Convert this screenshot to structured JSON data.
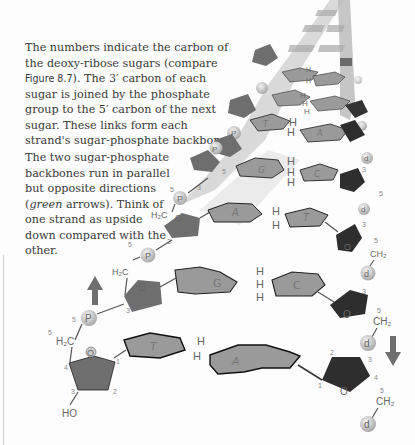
{
  "caption": {
    "paragraph1_a": "The numbers indicate the carbon of the deoxy-ribose sugars (compare ",
    "paragraph1_ref": "Figure 8.7",
    "paragraph1_b": "). The 3′ carbon of each sugar is joined by the phosphate group to the 5′ carbon of the next sugar. These links form each strand's sugar-phosphate backbone.",
    "paragraph2_a": "The two sugar-phosphate backbones run in parallel but opposite directions (",
    "paragraph2_em": "green",
    "paragraph2_b": " arrows). Think of one strand as upside down compared with the other."
  },
  "diagram": {
    "phosphate_label": "P",
    "oxygen_label": "O",
    "hydroxyl_label": "HO",
    "ch2_left": "H₂C",
    "ch2_right": "CH₂",
    "hydrogen_label": "H",
    "carbon_numbers": {
      "c1": "1",
      "c2": "2",
      "c3": "3",
      "c4": "4",
      "c5": "5"
    },
    "base_pairs": [
      {
        "left": "T",
        "right": "A",
        "h_bonds": 2
      },
      {
        "left": "G",
        "right": "C",
        "h_bonds": 3
      },
      {
        "left": "A",
        "right": "T",
        "h_bonds": 2
      },
      {
        "left": "G",
        "right": "C",
        "h_bonds": 3
      },
      {
        "left": "T",
        "right": "A",
        "h_bonds": 2
      },
      {
        "left": "C",
        "right": "G",
        "h_bonds": 3
      }
    ],
    "arrow_up": "strand-direction-up",
    "arrow_down": "strand-direction-down",
    "colors": {
      "sugar_left": "#6e6e6e",
      "sugar_right": "#2e2e2e",
      "base_fill": "#9a9a9a",
      "base_edge": "#222222",
      "phosphate": "#c8c8c8",
      "backbone_ribbon": "#bdbdbd",
      "arrow": "#6f6f6f"
    }
  }
}
